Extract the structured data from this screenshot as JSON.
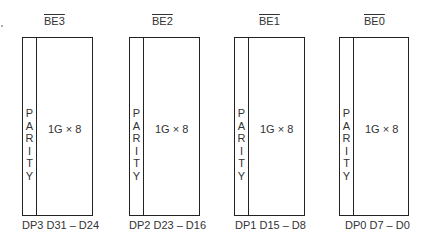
{
  "diagram": {
    "banks": [
      {
        "enable": "BE3",
        "parity_label": [
          "P",
          "A",
          "R",
          "I",
          "T",
          "Y"
        ],
        "capacity": "1G × 8",
        "data_lines": "DP3 D31 – D24"
      },
      {
        "enable": "BE2",
        "parity_label": [
          "P",
          "A",
          "R",
          "I",
          "T",
          "Y"
        ],
        "capacity": "1G × 8",
        "data_lines": "DP2 D23 – D16"
      },
      {
        "enable": "BE1",
        "parity_label": [
          "P",
          "A",
          "R",
          "I",
          "T",
          "Y"
        ],
        "capacity": "1G × 8",
        "data_lines": "DP1 D15 – D8"
      },
      {
        "enable": "BE0",
        "parity_label": [
          "P",
          "A",
          "R",
          "I",
          "T",
          "Y"
        ],
        "capacity": "1G × 8",
        "data_lines": "DP0 D7 – D0"
      }
    ]
  }
}
